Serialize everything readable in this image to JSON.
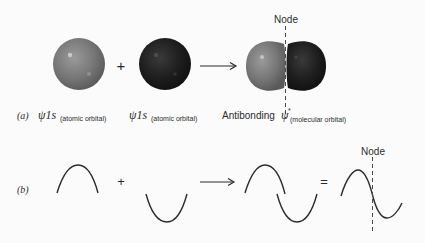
{
  "figure": {
    "part_a": {
      "label": "(a)",
      "operator_plus": "+",
      "node_label": "Node",
      "orbital_1": {
        "symbol": "ψ1s",
        "subscript": "(atomic orbital)",
        "color": "#7a7a7a"
      },
      "orbital_2": {
        "symbol": "ψ1s",
        "subscript": "(atomic orbital)",
        "color": "#1e1e1e"
      },
      "result": {
        "prefix": "Antibonding",
        "symbol": "ψ",
        "superscript": "*",
        "subscript": "(molecular orbital)",
        "left_lobe_color": "#7a7a7a",
        "right_lobe_color": "#1e1e1e"
      }
    },
    "part_b": {
      "label": "(b)",
      "operator_plus": "+",
      "operator_equals": "=",
      "node_label": "Node",
      "wave_1": "positive half-wave (crest)",
      "wave_2": "negative half-wave (trough)",
      "combined": "crest and trough placed side by side",
      "result": "sine wave with node"
    },
    "colors": {
      "background": "#fbfbfb",
      "line": "#2b2b2b",
      "node_dash": "#4a4a4a"
    }
  }
}
